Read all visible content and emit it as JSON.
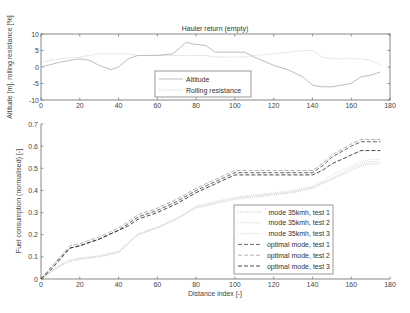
{
  "chart_data": [
    {
      "type": "line",
      "title": "Hauler return (empty)",
      "xlabel": "",
      "ylabel": "Altitude [m], rolling resistance [%]",
      "xlim": [
        0,
        180
      ],
      "ylim": [
        -10,
        10
      ],
      "xticks": [
        0,
        20,
        40,
        60,
        80,
        100,
        120,
        140,
        160,
        180
      ],
      "yticks": [
        -10,
        -5,
        0,
        5,
        10
      ],
      "grid": false,
      "legend_position": "lower center",
      "x": [
        0,
        10,
        20,
        25,
        30,
        36,
        40,
        45,
        50,
        60,
        68,
        72,
        75,
        78,
        85,
        90,
        100,
        105,
        110,
        120,
        128,
        135,
        140,
        145,
        150,
        160,
        165,
        170,
        175
      ],
      "series": [
        {
          "name": "Altitude",
          "style": "solid",
          "values": [
            0,
            1.5,
            2.5,
            2,
            0.5,
            -0.8,
            0,
            2.5,
            3.5,
            3.5,
            4,
            6,
            7.5,
            7,
            6.5,
            4.5,
            4.5,
            4.5,
            3,
            0.5,
            -1,
            -3,
            -5.5,
            -6,
            -6,
            -5,
            -3,
            -2.5,
            -1.5
          ]
        },
        {
          "name": "Rolling resistance",
          "style": "dotted",
          "values": [
            1.5,
            2.5,
            3,
            3.5,
            4,
            4,
            4,
            4,
            3.5,
            3.5,
            3.5,
            3.5,
            3.5,
            3.5,
            3.5,
            3,
            3,
            3,
            3.5,
            4,
            4.5,
            5,
            5,
            3,
            2.5,
            2.5,
            2.5,
            2,
            0.5
          ]
        }
      ]
    },
    {
      "type": "line",
      "title": "",
      "xlabel": "Distance index [-]",
      "ylabel": "Fuel consumption (normalised) [-]",
      "xlim": [
        0,
        180
      ],
      "ylim": [
        0,
        0.7
      ],
      "xticks": [
        0,
        20,
        40,
        60,
        80,
        100,
        120,
        140,
        160,
        180
      ],
      "yticks": [
        0,
        0.1,
        0.2,
        0.3,
        0.4,
        0.5,
        0.6,
        0.7
      ],
      "grid": false,
      "legend_position": "lower right",
      "x": [
        0,
        5,
        10,
        15,
        20,
        30,
        40,
        45,
        50,
        60,
        70,
        80,
        90,
        100,
        110,
        120,
        130,
        140,
        145,
        150,
        160,
        165,
        170,
        175
      ],
      "series": [
        {
          "name": "mode 35kmh, test 1",
          "style": "dotted",
          "values": [
            0,
            0.03,
            0.06,
            0.08,
            0.09,
            0.1,
            0.12,
            0.16,
            0.2,
            0.23,
            0.27,
            0.32,
            0.34,
            0.36,
            0.37,
            0.38,
            0.39,
            0.41,
            0.43,
            0.45,
            0.49,
            0.51,
            0.52,
            0.52
          ]
        },
        {
          "name": "mode 35kmh, test 2",
          "style": "dotted",
          "values": [
            0,
            0.035,
            0.065,
            0.085,
            0.095,
            0.105,
            0.125,
            0.165,
            0.205,
            0.235,
            0.275,
            0.325,
            0.345,
            0.365,
            0.375,
            0.385,
            0.395,
            0.415,
            0.435,
            0.455,
            0.5,
            0.52,
            0.53,
            0.53
          ]
        },
        {
          "name": "mode 35kmh, test 3",
          "style": "dotted",
          "values": [
            0,
            0.03,
            0.06,
            0.08,
            0.09,
            0.1,
            0.12,
            0.16,
            0.2,
            0.23,
            0.27,
            0.33,
            0.35,
            0.37,
            0.38,
            0.39,
            0.4,
            0.42,
            0.44,
            0.47,
            0.51,
            0.53,
            0.54,
            0.54
          ]
        },
        {
          "name": "optimal mode, test 1",
          "style": "dashed",
          "values": [
            0,
            0.05,
            0.1,
            0.14,
            0.15,
            0.18,
            0.22,
            0.25,
            0.28,
            0.31,
            0.35,
            0.4,
            0.44,
            0.48,
            0.48,
            0.48,
            0.48,
            0.48,
            0.51,
            0.55,
            0.6,
            0.62,
            0.62,
            0.62
          ]
        },
        {
          "name": "optimal mode, test 2",
          "style": "dashed",
          "values": [
            0,
            0.05,
            0.1,
            0.15,
            0.16,
            0.19,
            0.23,
            0.26,
            0.29,
            0.32,
            0.36,
            0.41,
            0.45,
            0.49,
            0.49,
            0.49,
            0.49,
            0.49,
            0.52,
            0.56,
            0.61,
            0.63,
            0.63,
            0.63
          ]
        },
        {
          "name": "optimal mode, test 3",
          "style": "dashed",
          "values": [
            0,
            0.04,
            0.09,
            0.14,
            0.15,
            0.18,
            0.22,
            0.24,
            0.27,
            0.3,
            0.34,
            0.39,
            0.43,
            0.47,
            0.47,
            0.47,
            0.47,
            0.47,
            0.49,
            0.52,
            0.56,
            0.58,
            0.58,
            0.58
          ]
        }
      ]
    }
  ],
  "style": {
    "colors": [
      "#bdbdbd",
      "#c9c9c9",
      "#d2d2d2",
      "#555555",
      "#a8a8a8",
      "#333333"
    ],
    "top_colors": [
      "#b5b5b5",
      "#c4c4c4"
    ]
  }
}
